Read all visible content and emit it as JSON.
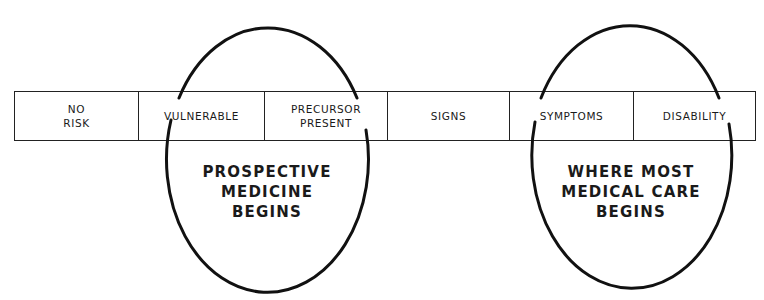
{
  "stages": [
    {
      "label": "NO\nRISK"
    },
    {
      "label": "VULNERABLE"
    },
    {
      "label": "PRECURSOR\nPRESENT"
    },
    {
      "label": "SIGNS"
    },
    {
      "label": "SYMPTOMS"
    },
    {
      "label": "DISABILITY"
    }
  ],
  "ovals": {
    "left": {
      "label": "PROSPECTIVE\nMEDICINE\nBEGINS"
    },
    "right": {
      "label": "WHERE  MOST\nMEDICAL CARE\nBEGINS"
    }
  },
  "colors": {
    "line": "#111111",
    "text": "#1a1a1a",
    "background": "#ffffff"
  }
}
